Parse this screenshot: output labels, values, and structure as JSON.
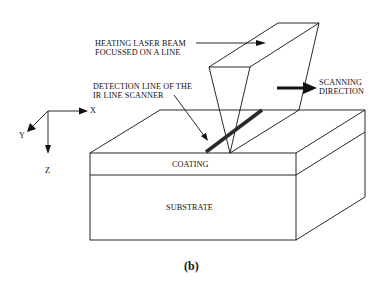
{
  "figure": {
    "caption": "(b)",
    "labels": {
      "laser_beam": [
        "HEATING LASER BEAM",
        "FOCUSSED ON A LINE"
      ],
      "detection_line": [
        "DETECTION LINE OF THE",
        "IR LINE SCANNER"
      ],
      "scanning_direction": [
        "SCANNING",
        "DIRECTION"
      ],
      "coating": "COATING",
      "substrate": "SUBSTRATE"
    },
    "axes": {
      "x": "X",
      "y": "Y",
      "z": "Z"
    },
    "colors": {
      "line": "#111111",
      "background": "#ffffff",
      "detection_bar": "#2a2a2a"
    }
  }
}
